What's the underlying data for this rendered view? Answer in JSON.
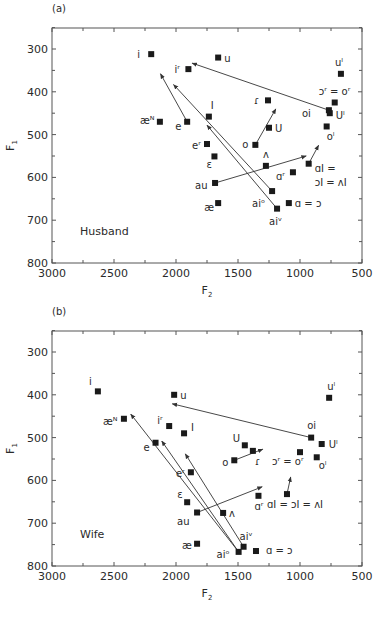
{
  "chart_data": [
    {
      "type": "scatter",
      "panel_label": "(a)",
      "annotation": "Husband",
      "xlabel": "F2",
      "ylabel": "F1",
      "xlim": [
        3000,
        500
      ],
      "ylim": [
        800,
        250
      ],
      "x_reversed": true,
      "y_reversed": true,
      "x_ticks": [
        3000,
        2500,
        2000,
        1500,
        1000,
        500
      ],
      "y_ticks": [
        300,
        400,
        500,
        600,
        700,
        800
      ],
      "grid": false,
      "marker": "filled-square",
      "points": [
        {
          "label": "i",
          "F2": 2200,
          "F1": 312,
          "lx": -14,
          "ly": 4
        },
        {
          "label": "u",
          "F2": 1660,
          "F1": 320,
          "lx": 6,
          "ly": 4
        },
        {
          "label": "iʳ",
          "F2": 1900,
          "F1": 347,
          "lx": -14,
          "ly": 4
        },
        {
          "label": "æᴺ",
          "F2": 2130,
          "F1": 470,
          "lx": -20,
          "ly": 2
        },
        {
          "label": "e",
          "F2": 1910,
          "F1": 470,
          "lx": -12,
          "ly": 8
        },
        {
          "label": "I",
          "F2": 1735,
          "F1": 458,
          "lx": 2,
          "ly": -8
        },
        {
          "label": "eʳ",
          "F2": 1750,
          "F1": 522,
          "lx": -15,
          "ly": 5
        },
        {
          "label": "ɛ",
          "F2": 1690,
          "F1": 551,
          "lx": -8,
          "ly": 12
        },
        {
          "label": "au",
          "F2": 1685,
          "F1": 613,
          "lx": -20,
          "ly": 6
        },
        {
          "label": "æ",
          "F2": 1660,
          "F1": 660,
          "lx": -14,
          "ly": 8
        },
        {
          "label": "ɾ",
          "F2": 1258,
          "F1": 420,
          "lx": -14,
          "ly": 4
        },
        {
          "label": "U",
          "F2": 1250,
          "F1": 484,
          "lx": 6,
          "ly": 4
        },
        {
          "label": "o",
          "F2": 1360,
          "F1": 524,
          "lx": -13,
          "ly": 3
        },
        {
          "label": "ʌ",
          "F2": 1275,
          "F1": 573,
          "lx": -3,
          "ly": -8
        },
        {
          "label": "ɑʳ",
          "F2": 1057,
          "F1": 588,
          "lx": -17,
          "ly": 8
        },
        {
          "label": "ɑI =",
          "F2": 930,
          "F1": 568,
          "lx": 6,
          "ly": 8
        },
        {
          "label": "ɔI = ʌI",
          "F2": 930,
          "F1": 568,
          "lx": 6,
          "ly": 22,
          "is_label_only": true
        },
        {
          "label": "aiᵒ",
          "F2": 1225,
          "F1": 632,
          "lx": -20,
          "ly": 16
        },
        {
          "label": "aiᵛ",
          "F2": 1185,
          "F1": 673,
          "lx": -8,
          "ly": 16
        },
        {
          "label": "ɑ = ɔ",
          "F2": 1090,
          "F1": 660,
          "lx": 6,
          "ly": 4
        },
        {
          "label": "uˡ",
          "F2": 670,
          "F1": 358,
          "lx": -6,
          "ly": -8
        },
        {
          "label": "ɔʳ = oʳ",
          "F2": 720,
          "F1": 425,
          "lx": -16,
          "ly": -8
        },
        {
          "label": "oi",
          "F2": 767,
          "F1": 443,
          "lx": -27,
          "ly": 7
        },
        {
          "label": "Uˡ",
          "F2": 760,
          "F1": 450,
          "lx": 6,
          "ly": 6
        },
        {
          "label": "oˡ",
          "F2": 785,
          "F1": 481,
          "lx": 0,
          "ly": 14
        }
      ],
      "arrows": [
        {
          "from": "oi",
          "x1": 767,
          "y1": 443,
          "x2": 1870,
          "y2": 333
        },
        {
          "from": "e",
          "x1": 1910,
          "y1": 470,
          "x2": 2125,
          "y2": 358
        },
        {
          "from": "aiᵒ",
          "x1": 1225,
          "y1": 632,
          "x2": 2020,
          "y2": 383
        },
        {
          "from": "aiᵛ",
          "x1": 1185,
          "y1": 673,
          "x2": 1750,
          "y2": 478
        },
        {
          "from": "au",
          "x1": 1685,
          "y1": 613,
          "x2": 950,
          "y2": 550
        },
        {
          "from": "o",
          "x1": 1360,
          "y1": 524,
          "x2": 1195,
          "y2": 440
        },
        {
          "from": "ɑI",
          "x1": 930,
          "y1": 568,
          "x2": 850,
          "y2": 525
        }
      ]
    },
    {
      "type": "scatter",
      "panel_label": "(b)",
      "annotation": "Wife",
      "xlabel": "F2",
      "ylabel": "F1",
      "xlim": [
        3000,
        500
      ],
      "ylim": [
        800,
        250
      ],
      "x_reversed": true,
      "y_reversed": true,
      "x_ticks": [
        3000,
        2500,
        2000,
        1500,
        1000,
        500
      ],
      "y_ticks": [
        300,
        400,
        500,
        600,
        700,
        800
      ],
      "grid": false,
      "marker": "filled-square",
      "points": [
        {
          "label": "i",
          "F2": 2630,
          "F1": 392,
          "lx": -9,
          "ly": -6
        },
        {
          "label": "u",
          "F2": 2015,
          "F1": 400,
          "lx": 6,
          "ly": 4
        },
        {
          "label": "uˡ",
          "F2": 765,
          "F1": 407,
          "lx": -2,
          "ly": -8
        },
        {
          "label": "æᴺ",
          "F2": 2420,
          "F1": 456,
          "lx": -21,
          "ly": 6
        },
        {
          "label": "iʳ",
          "F2": 2055,
          "F1": 473,
          "lx": -12,
          "ly": -2
        },
        {
          "label": "I",
          "F2": 1935,
          "F1": 490,
          "lx": 7,
          "ly": -2
        },
        {
          "label": "e",
          "F2": 2165,
          "F1": 512,
          "lx": -12,
          "ly": 8
        },
        {
          "label": "U",
          "F2": 1445,
          "F1": 518,
          "lx": -12,
          "ly": -3
        },
        {
          "label": "ɾ",
          "F2": 1380,
          "F1": 531,
          "lx": 2,
          "ly": 14
        },
        {
          "label": "o",
          "F2": 1530,
          "F1": 553,
          "lx": -12,
          "ly": 6
        },
        {
          "label": "oi",
          "F2": 910,
          "F1": 500,
          "lx": -4,
          "ly": -9
        },
        {
          "label": "Uˡ",
          "F2": 825,
          "F1": 515,
          "lx": 7,
          "ly": 4
        },
        {
          "label": "ɔʳ = oʳ",
          "F2": 1000,
          "F1": 534,
          "lx": -28,
          "ly": 13
        },
        {
          "label": "oˡ",
          "F2": 865,
          "F1": 546,
          "lx": 2,
          "ly": 12
        },
        {
          "label": "eʳ",
          "F2": 1880,
          "F1": 581,
          "lx": -15,
          "ly": 5
        },
        {
          "label": "ɛ",
          "F2": 1910,
          "F1": 651,
          "lx": -10,
          "ly": -4
        },
        {
          "label": "au",
          "F2": 1830,
          "F1": 675,
          "lx": -20,
          "ly": 12
        },
        {
          "label": "ʌ",
          "F2": 1620,
          "F1": 676,
          "lx": 6,
          "ly": 4
        },
        {
          "label": "ɑʳ",
          "F2": 1335,
          "F1": 636,
          "lx": -4,
          "ly": 14
        },
        {
          "label": "ɑI = ɔI = ʌI",
          "F2": 1105,
          "F1": 632,
          "lx": -20,
          "ly": 14
        },
        {
          "label": "æ",
          "F2": 1830,
          "F1": 748,
          "lx": -15,
          "ly": 5
        },
        {
          "label": "aiᵛ",
          "F2": 1455,
          "F1": 755,
          "lx": -4,
          "ly": -7
        },
        {
          "label": "aiᵒ",
          "F2": 1495,
          "F1": 767,
          "lx": -22,
          "ly": 6
        },
        {
          "label": "ɑ = ɔ",
          "F2": 1355,
          "F1": 765,
          "lx": 10,
          "ly": 3
        }
      ],
      "arrows": [
        {
          "from": "oi",
          "x1": 910,
          "y1": 500,
          "x2": 2030,
          "y2": 421
        },
        {
          "from": "aiᵒ",
          "x1": 1495,
          "y1": 767,
          "x2": 2365,
          "y2": 445
        },
        {
          "from": "aiᵒ",
          "x1": 1495,
          "y1": 767,
          "x2": 2115,
          "y2": 508
        },
        {
          "from": "aiᵛ",
          "x1": 1455,
          "y1": 755,
          "x2": 1925,
          "y2": 538
        },
        {
          "from": "au",
          "x1": 1830,
          "y1": 675,
          "x2": 1305,
          "y2": 615
        },
        {
          "from": "o",
          "x1": 1530,
          "y1": 553,
          "x2": 1300,
          "y2": 527
        },
        {
          "from": "ɑI",
          "x1": 1105,
          "y1": 632,
          "x2": 1075,
          "y2": 592
        }
      ]
    }
  ]
}
